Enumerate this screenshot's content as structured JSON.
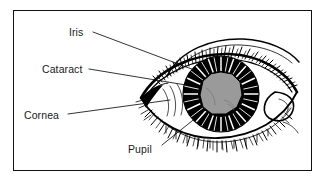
{
  "figure": {
    "kind": "anatomical-line-drawing",
    "frame_color": "#111111",
    "background_color": "#ffffff",
    "ink_color": "#000000",
    "cataract_fill": "#9a9a9a",
    "cataract_shade": "#8b8b8b"
  },
  "labels": {
    "iris": "Iris",
    "cataract": "Cataract",
    "cornea": "Cornea",
    "pupil": "Pupil"
  },
  "leaders": {
    "iris": {
      "from": [
        93,
        32
      ],
      "to": [
        205,
        74
      ]
    },
    "cataract": {
      "from": [
        89,
        69
      ],
      "to": [
        191,
        85
      ]
    },
    "cornea": {
      "from": [
        68,
        114
      ],
      "to": [
        168,
        99
      ]
    },
    "pupil": {
      "from": [
        160,
        146
      ],
      "to": [
        196,
        118
      ]
    }
  }
}
